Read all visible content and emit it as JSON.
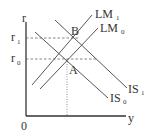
{
  "diagram": {
    "axes": {
      "y_label": "r",
      "x_label": "y",
      "origin_label": "0"
    },
    "levels": {
      "r1": {
        "base": "r",
        "sub": "1"
      },
      "r0": {
        "base": "r",
        "sub": "0"
      }
    },
    "points": {
      "A": "A",
      "B": "B"
    },
    "curves": {
      "LM1": {
        "base": "LM",
        "sub": "1"
      },
      "LM0": {
        "base": "LM",
        "sub": "0"
      },
      "IS1": {
        "base": "IS",
        "sub": "1"
      },
      "IS0": {
        "base": "IS",
        "sub": "0"
      }
    },
    "colors": {
      "axis": "#333333",
      "curve": "#555555",
      "text": "#333333",
      "background": "#ffffff"
    }
  }
}
